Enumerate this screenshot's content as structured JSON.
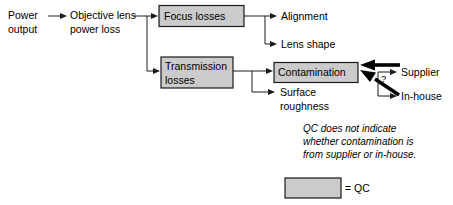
{
  "diagram": {
    "colors": {
      "qc_fill": "#cbcbcb",
      "stroke": "#1a1a1a",
      "background": "#ffffff",
      "thick_arrow": "#000000"
    },
    "root": {
      "line1": "Power",
      "line2": "output"
    },
    "level1": {
      "line1": "Objective lens",
      "line2": "power loss"
    },
    "boxes": [
      {
        "id": "focus-losses",
        "line1": "Focus losses",
        "line2": "",
        "qc": true
      },
      {
        "id": "transmission-losses",
        "line1": "Transmission",
        "line2": "losses",
        "qc": true
      },
      {
        "id": "contamination",
        "line1": "Contamination",
        "line2": "",
        "qc": true
      }
    ],
    "leaves": [
      {
        "id": "alignment",
        "line1": "Alignment",
        "line2": ""
      },
      {
        "id": "lens-shape",
        "line1": "Lens shape",
        "line2": ""
      },
      {
        "id": "surface-roughness",
        "line1": "Surface",
        "line2": "roughness"
      },
      {
        "id": "supplier",
        "line1": "Supplier",
        "line2": ""
      },
      {
        "id": "in-house",
        "line1": "In-house",
        "line2": ""
      }
    ],
    "question_mark": "?",
    "note": {
      "line1": "QC does not indicate",
      "line2": "whether contamination is",
      "line3": "from supplier or in-house."
    },
    "legend": {
      "label": "= QC"
    }
  }
}
